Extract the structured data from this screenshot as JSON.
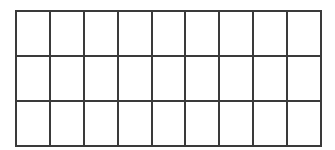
{
  "grid": {
    "rows": 3,
    "columns": 9,
    "line_color": "#3a3a3a",
    "background": "#ffffff"
  }
}
